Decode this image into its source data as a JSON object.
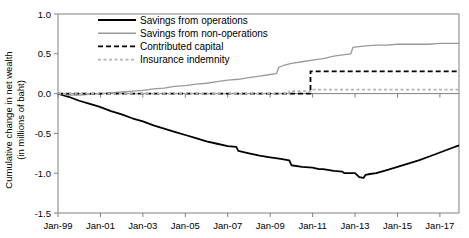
{
  "chart_data": {
    "type": "line",
    "title": "",
    "xlabel": "",
    "ylabel": "Cumulative change in net wealth (in millions of baht)",
    "ylabel_line1": "Cumulative change in net wealth",
    "ylabel_line2": "(in millions of baht)",
    "ylim": [
      -1.5,
      1.0
    ],
    "yticks": [
      "1.0",
      "0.5",
      "0.0",
      "-0.5",
      "-1.0",
      "-1.5"
    ],
    "ytick_values": [
      1.0,
      0.5,
      0.0,
      -0.5,
      -1.0,
      -1.5
    ],
    "xlim": [
      1999,
      2017.9
    ],
    "xticks": [
      "Jan-99",
      "Jan-01",
      "Jan-03",
      "Jan-05",
      "Jan-07",
      "Jan-09",
      "Jan-11",
      "Jan-13",
      "Jan-15",
      "Jan-17"
    ],
    "xtick_values": [
      1999,
      2001,
      2003,
      2005,
      2007,
      2009,
      2011,
      2013,
      2015,
      2017
    ],
    "grid": false,
    "legend_position": "top-center",
    "colors": {
      "savings_operations": "#000000",
      "savings_non_operations": "#999999",
      "contributed_capital": "#000000",
      "insurance_indemnity": "#b3b3b3",
      "axis": "#808080"
    },
    "series": [
      {
        "name": "Savings from operations",
        "style": "solid",
        "color": "#000000",
        "x": [
          1999.0,
          1999.5,
          2000.0,
          2000.5,
          2000.9,
          2001.0,
          2001.5,
          2002.0,
          2002.5,
          2003.0,
          2003.5,
          2004.0,
          2004.5,
          2005.0,
          2005.5,
          2006.0,
          2006.5,
          2007.0,
          2007.4,
          2007.5,
          2008.0,
          2008.5,
          2009.0,
          2009.5,
          2009.9,
          2010.0,
          2010.5,
          2011.0,
          2011.3,
          2011.5,
          2012.0,
          2012.4,
          2012.5,
          2013.0,
          2013.2,
          2013.4,
          2013.5,
          2013.7,
          2014.0,
          2014.5,
          2015.0,
          2015.5,
          2016.0,
          2016.5,
          2017.0,
          2017.5,
          2017.9
        ],
        "y": [
          0.0,
          -0.04,
          -0.09,
          -0.13,
          -0.16,
          -0.17,
          -0.22,
          -0.26,
          -0.31,
          -0.35,
          -0.4,
          -0.44,
          -0.48,
          -0.52,
          -0.56,
          -0.6,
          -0.63,
          -0.66,
          -0.67,
          -0.72,
          -0.75,
          -0.78,
          -0.8,
          -0.82,
          -0.84,
          -0.9,
          -0.92,
          -0.93,
          -0.95,
          -0.95,
          -0.97,
          -0.98,
          -1.0,
          -1.0,
          -1.05,
          -1.06,
          -1.02,
          -1.01,
          -1.0,
          -0.96,
          -0.92,
          -0.88,
          -0.84,
          -0.79,
          -0.74,
          -0.69,
          -0.65
        ]
      },
      {
        "name": "Savings from non-operations",
        "style": "solid",
        "color": "#999999",
        "x": [
          1999.0,
          1999.5,
          2000.0,
          2000.5,
          2001.0,
          2001.5,
          2002.0,
          2002.5,
          2003.0,
          2003.5,
          2004.0,
          2004.5,
          2005.0,
          2005.5,
          2006.0,
          2006.5,
          2007.0,
          2007.5,
          2008.0,
          2008.5,
          2009.0,
          2009.3,
          2009.4,
          2009.6,
          2010.0,
          2010.5,
          2011.0,
          2011.5,
          2012.0,
          2012.5,
          2012.8,
          2012.9,
          2013.2,
          2013.5,
          2014.0,
          2014.5,
          2015.0,
          2015.5,
          2016.0,
          2016.5,
          2017.0,
          2017.5,
          2017.9
        ],
        "y": [
          0.0,
          -0.02,
          -0.02,
          -0.01,
          0.0,
          0.01,
          0.02,
          0.03,
          0.04,
          0.06,
          0.07,
          0.09,
          0.1,
          0.12,
          0.13,
          0.15,
          0.17,
          0.18,
          0.2,
          0.22,
          0.24,
          0.25,
          0.33,
          0.35,
          0.38,
          0.4,
          0.42,
          0.44,
          0.47,
          0.49,
          0.5,
          0.58,
          0.59,
          0.6,
          0.61,
          0.61,
          0.62,
          0.62,
          0.62,
          0.62,
          0.63,
          0.63,
          0.63
        ]
      },
      {
        "name": "Contributed capital",
        "style": "dashed",
        "color": "#000000",
        "x": [
          1999.0,
          2010.9,
          2010.9,
          2017.9
        ],
        "y": [
          0.0,
          0.0,
          0.28,
          0.28
        ]
      },
      {
        "name": "Insurance indemnity",
        "style": "dashed",
        "color": "#b3b3b3",
        "x": [
          1999.0,
          2009.9,
          2009.9,
          2010.9,
          2010.9,
          2017.9
        ],
        "y": [
          0.0,
          0.0,
          0.03,
          0.03,
          0.05,
          0.05
        ]
      }
    ]
  },
  "legend": {
    "items": [
      {
        "label": "Savings from operations",
        "style": "solid",
        "color": "#000000"
      },
      {
        "label": "Savings from non-operations",
        "style": "solid",
        "color": "#999999"
      },
      {
        "label": "Contributed capital",
        "style": "dashed",
        "color": "#000000"
      },
      {
        "label": "Insurance indemnity",
        "style": "dashed",
        "color": "#b3b3b3"
      }
    ]
  }
}
